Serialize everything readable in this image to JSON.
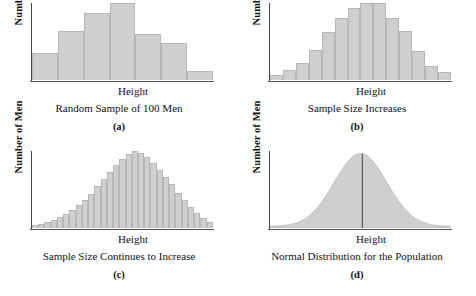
{
  "figure": {
    "background": "#ffffff",
    "fill_color": "#cfcfcf",
    "stroke_color": "#b7b7b7",
    "axis_color": "#444444"
  },
  "chart_data": [
    {
      "type": "bar",
      "panel": "a",
      "title": "Random Sample of 100 Men",
      "letter": "(a)",
      "xlabel": "Height",
      "ylabel": "Number of Men",
      "categories": [
        "1",
        "2",
        "3",
        "4",
        "5",
        "6",
        "7"
      ],
      "values": [
        27,
        50,
        68,
        78,
        47,
        37,
        9
      ],
      "ylim": [
        0,
        78
      ],
      "grid": false,
      "legend": "none"
    },
    {
      "type": "bar",
      "panel": "b",
      "title": "Sample Size Increases",
      "letter": "(b)",
      "xlabel": "Height",
      "ylabel": "Number of Men",
      "categories": [
        "1",
        "2",
        "3",
        "4",
        "5",
        "6",
        "7",
        "8",
        "9",
        "10",
        "11",
        "12",
        "13"
      ],
      "values": [
        5,
        10,
        17,
        29,
        47,
        60,
        70,
        75,
        75,
        60,
        48,
        28,
        14,
        8
      ],
      "ylim": [
        0,
        75
      ],
      "grid": false,
      "legend": "none"
    },
    {
      "type": "bar",
      "panel": "c",
      "title": "Sample Size Continues to Increase",
      "letter": "(c)",
      "xlabel": "Height",
      "ylabel": "Number of Men",
      "categories": [
        "1",
        "2",
        "3",
        "4",
        "5",
        "6",
        "7",
        "8",
        "9",
        "10",
        "11",
        "12",
        "13",
        "14",
        "15",
        "16",
        "17",
        "18",
        "19",
        "20",
        "21",
        "22",
        "23",
        "24",
        "25",
        "26",
        "27",
        "28",
        "29"
      ],
      "values": [
        3,
        4,
        6,
        8,
        11,
        14,
        18,
        23,
        28,
        34,
        41,
        48,
        55,
        62,
        68,
        73,
        76,
        74,
        70,
        64,
        57,
        50,
        43,
        35,
        28,
        21,
        15,
        10,
        6
      ],
      "ylim": [
        0,
        76
      ],
      "grid": false,
      "legend": "none"
    },
    {
      "type": "area",
      "panel": "d",
      "title": "Normal Distribution for the Population",
      "letter": "(d)",
      "xlabel": "Height",
      "ylabel": "Number of Men",
      "curve": "normal",
      "mean_line_position": 0.51,
      "ylim": [
        0,
        76
      ],
      "grid": false,
      "legend": "none"
    }
  ]
}
